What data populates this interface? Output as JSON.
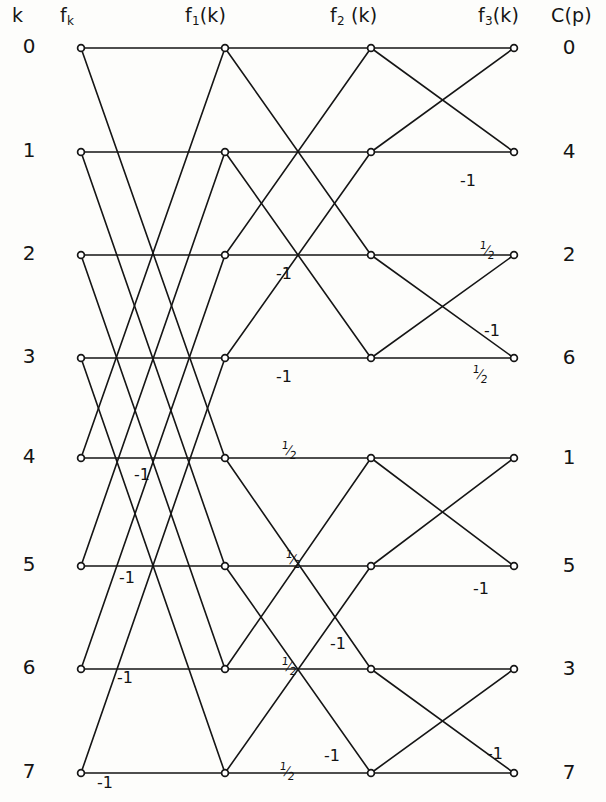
{
  "figure": {
    "type": "signal-flow-graph",
    "width": 606,
    "height": 802,
    "line_color": "#151515",
    "node_fill": "#ffffff",
    "background": "#fdfdfb"
  },
  "headers": {
    "index": "k",
    "stage0": "f",
    "stage0_sub": "k",
    "stage1": "f",
    "stage1_sub": "1",
    "stage1_tail": "(k)",
    "stage2": "f",
    "stage2_sub": "2",
    "stage2_tail": " (k)",
    "stage3": "f",
    "stage3_sub": "3",
    "stage3_tail": "(k)",
    "output": "C(p)"
  },
  "columns": {
    "x": [
      81,
      225,
      371,
      514
    ],
    "labels": [
      "f_k",
      "f_1(k)",
      "f_2(k)",
      "f_3(k)"
    ],
    "header_x": [
      60,
      185,
      330,
      478
    ],
    "header_y": 18
  },
  "rows": {
    "y": [
      48,
      152,
      255,
      358,
      458,
      566,
      669,
      773
    ],
    "index_x": 16,
    "output_x": 556,
    "indices": [
      "0",
      "1",
      "2",
      "3",
      "4",
      "5",
      "6",
      "7"
    ],
    "outputs": [
      "0",
      "4",
      "2",
      "6",
      "1",
      "5",
      "3",
      "7"
    ]
  },
  "edges": {
    "stage1_pairs": [
      [
        0,
        4
      ],
      [
        1,
        5
      ],
      [
        2,
        6
      ],
      [
        3,
        7
      ]
    ],
    "stage2_pairs": [
      [
        0,
        2
      ],
      [
        1,
        3
      ],
      [
        4,
        6
      ],
      [
        5,
        7
      ]
    ],
    "stage3_pairs": [
      [
        0,
        1
      ],
      [
        2,
        3
      ],
      [
        4,
        5
      ],
      [
        6,
        7
      ]
    ]
  },
  "weight_labels": [
    {
      "text": "-1",
      "x": 460,
      "y": 173,
      "kind": "minus-one"
    },
    {
      "text": "-1",
      "x": 276,
      "y": 266,
      "kind": "minus-one"
    },
    {
      "text": "½",
      "x": 479,
      "y": 240,
      "kind": "half"
    },
    {
      "text": "-1",
      "x": 484,
      "y": 323,
      "kind": "minus-one"
    },
    {
      "text": "-1",
      "x": 276,
      "y": 369,
      "kind": "minus-one"
    },
    {
      "text": "½",
      "x": 472,
      "y": 364,
      "kind": "half"
    },
    {
      "text": "-1",
      "x": 134,
      "y": 467,
      "kind": "minus-one"
    },
    {
      "text": "½",
      "x": 281,
      "y": 440,
      "kind": "half"
    },
    {
      "text": "-1",
      "x": 119,
      "y": 570,
      "kind": "minus-one"
    },
    {
      "text": "½",
      "x": 285,
      "y": 549,
      "kind": "half"
    },
    {
      "text": "-1",
      "x": 473,
      "y": 581,
      "kind": "minus-one"
    },
    {
      "text": "-1",
      "x": 117,
      "y": 670,
      "kind": "minus-one"
    },
    {
      "text": "½",
      "x": 281,
      "y": 656,
      "kind": "half"
    },
    {
      "text": "-1",
      "x": 330,
      "y": 636,
      "kind": "minus-one"
    },
    {
      "text": "-1",
      "x": 97,
      "y": 775,
      "kind": "minus-one"
    },
    {
      "text": "½",
      "x": 279,
      "y": 761,
      "kind": "half"
    },
    {
      "text": "-1",
      "x": 324,
      "y": 748,
      "kind": "minus-one"
    },
    {
      "text": "-1",
      "x": 487,
      "y": 746,
      "kind": "minus-one"
    }
  ],
  "chart_data": {
    "type": "diagram",
    "stages": 3,
    "points": 8,
    "input_labels": [
      "f_k"
    ],
    "stage_labels": [
      "f_k",
      "f_1(k)",
      "f_2(k)",
      "f_3(k)"
    ],
    "input_indices": [
      0,
      1,
      2,
      3,
      4,
      5,
      6,
      7
    ],
    "output_order": [
      0,
      4,
      2,
      6,
      1,
      5,
      3,
      7
    ],
    "multipliers": [
      "-1",
      "½"
    ]
  }
}
